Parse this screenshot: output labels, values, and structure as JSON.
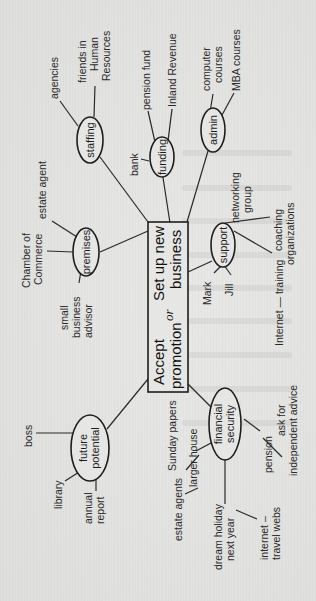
{
  "diagram": {
    "type": "mind-map",
    "orientation": "rotated-90-ccw",
    "colors": {
      "ink": "#1e1e1e",
      "paper": "#e4e4e2"
    },
    "central": {
      "line1": "Accept",
      "line2": "promotion",
      "or": "or",
      "line3": "Set up new",
      "line4": "business"
    },
    "branches": {
      "staffing": {
        "label": "staffing",
        "leaves": {
          "agencies": "agencies",
          "friends_hr_1": "friends in",
          "friends_hr_2": "Human",
          "friends_hr_3": "Resources"
        }
      },
      "funding": {
        "label": "funding",
        "leaves": {
          "bank": "bank",
          "pension_fund": "pension fund",
          "inland_revenue": "Inland Revenue"
        }
      },
      "admin": {
        "label": "admin",
        "leaves": {
          "computer_courses_1": "computer",
          "computer_courses_2": "courses",
          "mba_courses": "MBA courses"
        }
      },
      "premises": {
        "label": "premises",
        "leaves": {
          "estate_agent": "estate agent",
          "chamber_1": "Chamber of",
          "chamber_2": "Commerce",
          "advisor_1": "small",
          "advisor_2": "business",
          "advisor_3": "advisor"
        }
      },
      "support": {
        "label": "support",
        "leaves": {
          "networking_1": "networking",
          "networking_2": "group",
          "coaching_1": "coaching",
          "coaching_2": "organizations",
          "internet_training": "Internet — training",
          "mark": "Mark",
          "jill": "Jill"
        }
      },
      "future_potential": {
        "label_1": "future",
        "label_2": "potential",
        "leaves": {
          "boss": "boss",
          "library": "library",
          "annual_report_1": "annual",
          "annual_report_2": "report"
        }
      },
      "financial_security": {
        "label_1": "financial",
        "label_2": "security",
        "leaves": {
          "larger_house": "larger house",
          "sunday_papers": "Sunday papers",
          "estate_agents": "estate agents",
          "pension": "pension",
          "advice_1": "ask for",
          "advice_2": "independent advice",
          "holiday_1": "dream holiday",
          "holiday_2": "next year",
          "travel_1": "internet –",
          "travel_2": "travel webs"
        }
      }
    }
  }
}
